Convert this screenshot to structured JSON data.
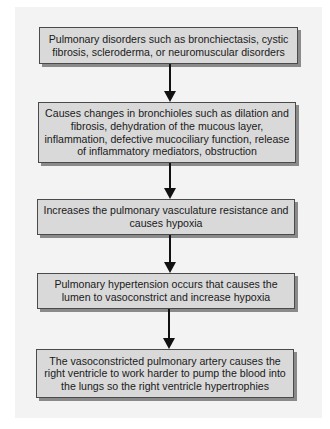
{
  "flowchart": {
    "steps": [
      {
        "text": "Pulmonary disorders such as bronchiectasis, cystic fibrosis, scleroderma, or neuromuscular disorders"
      },
      {
        "text": "Causes changes in bronchioles such as dilation and fibrosis, dehydration of the mucous layer, inflammation, defective mucociliary function, release of inflammatory mediators, obstruction"
      },
      {
        "text": "Increases the pulmonary vasculature resistance and causes hypoxia"
      },
      {
        "text": "Pulmonary hypertension occurs that causes the lumen to vasoconstrict and increase hypoxia"
      },
      {
        "text": "The vasoconstricted pulmonary artery causes the right ventricle to work harder to pump the blood into the lungs so the right ventricle hypertrophies"
      }
    ],
    "arrow_icon": "arrow-down-icon",
    "colors": {
      "panel_background": "#f3f3f3",
      "box_fill": "#d9d9d9",
      "box_border": "#4a4a4a",
      "box_shadow": "#8a8a8a",
      "arrow": "#111111"
    }
  }
}
